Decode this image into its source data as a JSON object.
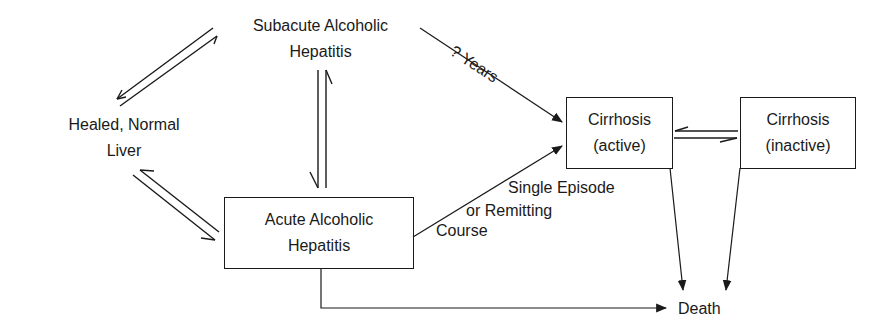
{
  "nodes": {
    "subacute": {
      "line1": "Subacute Alcoholic",
      "line2": "Hepatitis",
      "boxed": false
    },
    "healed": {
      "line1": "Healed, Normal",
      "line2": "Liver",
      "boxed": false
    },
    "acute": {
      "line1": "Acute Alcoholic",
      "line2": "Hepatitis",
      "boxed": true
    },
    "cirrhosis_active": {
      "line1": "Cirrhosis",
      "line2": "(active)",
      "boxed": true
    },
    "cirrhosis_inactive": {
      "line1": "Cirrhosis",
      "line2": "(inactive)",
      "boxed": true
    },
    "death": {
      "label": "Death",
      "boxed": false
    }
  },
  "edge_labels": {
    "years": "? Years",
    "single_episode": {
      "line1": "Single Episode",
      "line2": "or Remitting",
      "line3": "Course"
    }
  },
  "edges": [
    {
      "from": "subacute",
      "to": "healed",
      "type": "reversible"
    },
    {
      "from": "healed",
      "to": "acute",
      "type": "reversible"
    },
    {
      "from": "subacute",
      "to": "acute",
      "type": "reversible"
    },
    {
      "from": "subacute",
      "to": "cirrhosis_active",
      "label": "? Years",
      "type": "directed"
    },
    {
      "from": "acute",
      "to": "cirrhosis_active",
      "label": "Single Episode or Remitting Course",
      "type": "directed"
    },
    {
      "from": "cirrhosis_active",
      "to": "cirrhosis_inactive",
      "type": "reversible"
    },
    {
      "from": "cirrhosis_active",
      "to": "death",
      "type": "directed"
    },
    {
      "from": "cirrhosis_inactive",
      "to": "death",
      "type": "directed"
    },
    {
      "from": "acute",
      "to": "death",
      "type": "directed"
    }
  ],
  "colors": {
    "ink": "#1a1a1a",
    "background": "#ffffff"
  }
}
